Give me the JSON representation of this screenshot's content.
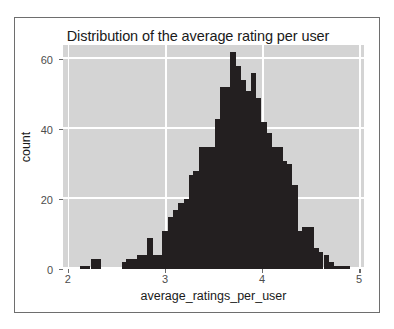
{
  "chart_data": {
    "type": "bar",
    "title": "Distribution of the average rating per user",
    "xlabel": "average_ratings_per_user",
    "ylabel": "count",
    "xlim": [
      1.95,
      5.05
    ],
    "ylim": [
      0,
      64
    ],
    "grid": true,
    "legend": null,
    "xticks": [
      2,
      3,
      4,
      5
    ],
    "xtick_labels": [
      "2",
      "3",
      "4",
      "5"
    ],
    "yticks": [
      0,
      20,
      40,
      60
    ],
    "ytick_labels": [
      "0",
      "20",
      "40",
      "60"
    ],
    "bin_width": 0.0535,
    "bar_color": "#231f20",
    "panel_color": "#d4d4d4",
    "gridline_color": "#ffffff",
    "x": [
      2.15,
      2.2,
      2.26,
      2.31,
      2.36,
      2.42,
      2.47,
      2.52,
      2.58,
      2.63,
      2.68,
      2.74,
      2.79,
      2.84,
      2.9,
      2.95,
      3.0,
      3.06,
      3.11,
      3.16,
      3.22,
      3.27,
      3.32,
      3.38,
      3.43,
      3.48,
      3.54,
      3.59,
      3.64,
      3.7,
      3.75,
      3.8,
      3.86,
      3.91,
      3.96,
      4.02,
      4.07,
      4.12,
      4.18,
      4.23,
      4.28,
      4.34,
      4.39,
      4.44,
      4.5,
      4.55,
      4.6,
      4.66,
      4.71,
      4.76,
      4.82,
      4.87
    ],
    "values": [
      1,
      1,
      3,
      3,
      0,
      0,
      0,
      0,
      2,
      3,
      3,
      4,
      4,
      9,
      4,
      4,
      11,
      15,
      17,
      19,
      20,
      27,
      28,
      35,
      35,
      35,
      43,
      52,
      52,
      62,
      58,
      54,
      51,
      56,
      49,
      42,
      39,
      35,
      35,
      31,
      30,
      24,
      11,
      12,
      12,
      6,
      5,
      4,
      2,
      1,
      1,
      1
    ]
  },
  "figure": {
    "background": "#ffffff",
    "border_color": "#6e6e6e"
  }
}
